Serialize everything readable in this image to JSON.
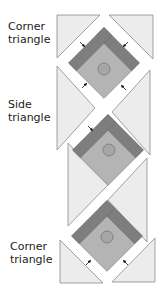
{
  "labels": {
    "top_corner": [
      "Corner",
      "triangle"
    ],
    "side": [
      "Side",
      "triangle"
    ],
    "bottom_corner": [
      "Corner",
      "triangle"
    ]
  },
  "colors": {
    "background_triangle": "#ececec",
    "triangle_stroke": "#8a8a8a",
    "dark_strip": "#7e7e7e",
    "block_light": "#b4b4b4",
    "center_circle": "#a6a6a6",
    "arrow": "#111111"
  },
  "blocks": [
    {
      "name": "top",
      "center": [
        104,
        63
      ]
    },
    {
      "name": "middle",
      "center": [
        108,
        150
      ]
    },
    {
      "name": "bottom",
      "center": [
        107,
        236
      ]
    }
  ]
}
